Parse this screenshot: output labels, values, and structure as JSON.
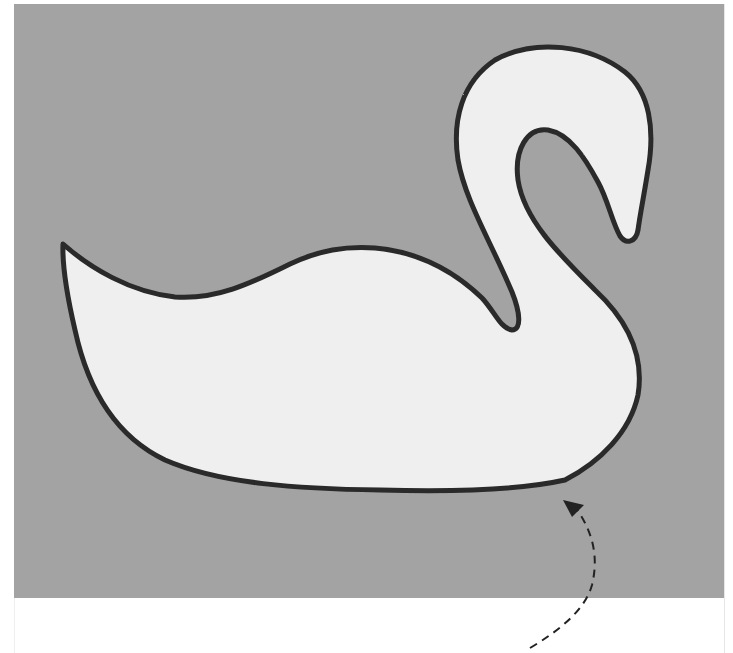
{
  "image": {
    "subject": "swan appliqué on fabric",
    "colors": {
      "page_background": "#ffffff",
      "fabric": "#a3a3a3",
      "swan_fill": "#efefef",
      "outline_stitch": "#2a2a2a",
      "arrow": "#222222"
    },
    "annotation": {
      "type": "dashed-arrow",
      "points_to": "stitched outline at bottom of swan body"
    }
  }
}
